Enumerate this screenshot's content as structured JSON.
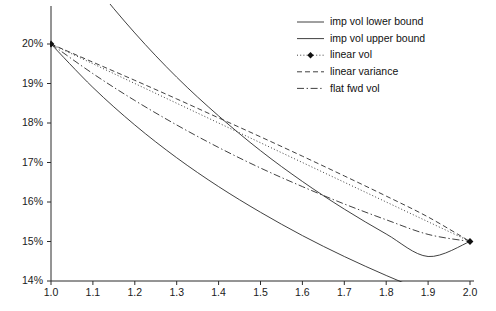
{
  "chart_data": {
    "type": "line",
    "title": "",
    "xlabel": "",
    "ylabel": "",
    "xlim": [
      1.0,
      2.0
    ],
    "ylim": [
      0.14,
      0.2
    ],
    "grid": false,
    "legend_position": "top-right",
    "x_ticks": [
      "1.0",
      "1.1",
      "1.2",
      "1.3",
      "1.4",
      "1.5",
      "1.6",
      "1.7",
      "1.8",
      "1.9",
      "2.0"
    ],
    "x_tick_values": [
      1.0,
      1.1,
      1.2,
      1.3,
      1.4,
      1.5,
      1.6,
      1.7,
      1.8,
      1.9,
      2.0
    ],
    "y_ticks": [
      "14%",
      "15%",
      "16%",
      "17%",
      "18%",
      "19%",
      "20%"
    ],
    "y_tick_values": [
      0.14,
      0.15,
      0.16,
      0.17,
      0.18,
      0.19,
      0.2
    ],
    "x": [
      1.0,
      1.1,
      1.2,
      1.3,
      1.4,
      1.5,
      1.6,
      1.7,
      1.8,
      1.9,
      2.0
    ],
    "series": [
      {
        "name": "imp vol lower bound",
        "style": "solid",
        "marker": "none",
        "color": "#2b2b2b",
        "values": [
          0.2,
          0.189,
          0.1795,
          0.1712,
          0.1639,
          0.1574,
          0.1515,
          0.1462,
          0.1414,
          0.137,
          0.133
        ]
      },
      {
        "name": "imp vol upper bound",
        "style": "solid",
        "marker": "none",
        "color": "#2b2b2b",
        "clipped_above_axis": true,
        "values": [
          0.23,
          0.2155,
          0.2028,
          0.1916,
          0.1818,
          0.173,
          0.1652,
          0.1582,
          0.1519,
          0.1462,
          0.15
        ]
      },
      {
        "name": "linear vol",
        "style": "dotted",
        "marker": "diamond",
        "color": "#2b2b2b",
        "values": [
          0.2,
          0.195,
          0.19,
          0.185,
          0.18,
          0.175,
          0.17,
          0.165,
          0.16,
          0.155,
          0.15
        ]
      },
      {
        "name": "linear variance",
        "style": "dashed",
        "marker": "none",
        "color": "#2b2b2b",
        "values": [
          0.2,
          0.1954,
          0.1908,
          0.1861,
          0.1813,
          0.1765,
          0.1716,
          0.1666,
          0.1615,
          0.1562,
          0.15
        ]
      },
      {
        "name": "flat fwd vol",
        "style": "dashdot",
        "marker": "none",
        "color": "#2b2b2b",
        "values": [
          0.2,
          0.1925,
          0.1857,
          0.1795,
          0.1738,
          0.1686,
          0.1639,
          0.1595,
          0.1555,
          0.1518,
          0.15
        ]
      }
    ],
    "markers": [
      {
        "x": 1.0,
        "y": 0.2
      },
      {
        "x": 2.0,
        "y": 0.15
      }
    ]
  },
  "legend": {
    "items": [
      {
        "label": "imp vol lower bound",
        "style": "solid",
        "marker": "none"
      },
      {
        "label": "imp vol upper bound",
        "style": "solid",
        "marker": "none"
      },
      {
        "label": "linear vol",
        "style": "dotted",
        "marker": "diamond"
      },
      {
        "label": "linear variance",
        "style": "dashed",
        "marker": "none"
      },
      {
        "label": "flat fwd vol",
        "style": "dashdot",
        "marker": "none"
      }
    ]
  },
  "axes": {
    "x_tick_labels": [
      "1.0",
      "1.1",
      "1.2",
      "1.3",
      "1.4",
      "1.5",
      "1.6",
      "1.7",
      "1.8",
      "1.9",
      "2.0"
    ],
    "y_tick_labels": [
      "14%",
      "15%",
      "16%",
      "17%",
      "18%",
      "19%",
      "20%"
    ]
  }
}
